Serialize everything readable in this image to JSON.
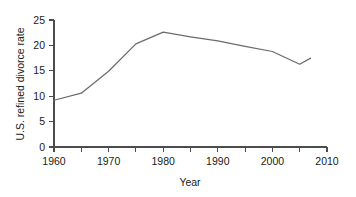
{
  "chart_data": {
    "type": "line",
    "title": "",
    "xlabel": "Year",
    "ylabel": "U.S. refined divorce rate",
    "xlim": [
      1960,
      2010
    ],
    "ylim": [
      0,
      25
    ],
    "grid": false,
    "legend": false,
    "line_color": "#6b6b6b",
    "axis_color": "#4d4d4d",
    "background_color": "#ffffff",
    "x": [
      1960,
      1965,
      1970,
      1975,
      1980,
      1985,
      1990,
      1995,
      2000,
      2005,
      2007
    ],
    "values": [
      9.2,
      10.6,
      14.9,
      20.3,
      22.6,
      21.7,
      20.9,
      19.8,
      18.8,
      16.3,
      17.5
    ],
    "series": [
      {
        "name": "U.S. refined divorce rate",
        "values": [
          9.2,
          10.6,
          14.9,
          20.3,
          22.6,
          21.7,
          20.9,
          19.8,
          18.8,
          16.3,
          17.5
        ]
      }
    ],
    "xticks": [
      1960,
      1965,
      1970,
      1975,
      1980,
      1985,
      1990,
      1995,
      2000,
      2005,
      2010
    ],
    "xtick_labels": [
      "1960",
      "",
      "1970",
      "",
      "1980",
      "",
      "1990",
      "",
      "2000",
      "",
      "2010"
    ],
    "yticks": [
      0,
      5,
      10,
      15,
      20,
      25
    ],
    "ytick_labels": [
      "0",
      "5",
      "10",
      "15",
      "20",
      "25"
    ]
  },
  "axes": {
    "x_title": "Year",
    "y_title": "U.S. refined divorce rate",
    "x_labels": {
      "t1960": "1960",
      "t1970": "1970",
      "t1980": "1980",
      "t1990": "1990",
      "t2000": "2000",
      "t2010": "2010"
    },
    "y_labels": {
      "v0": "0",
      "v5": "5",
      "v10": "10",
      "v15": "15",
      "v20": "20",
      "v25": "25"
    }
  }
}
